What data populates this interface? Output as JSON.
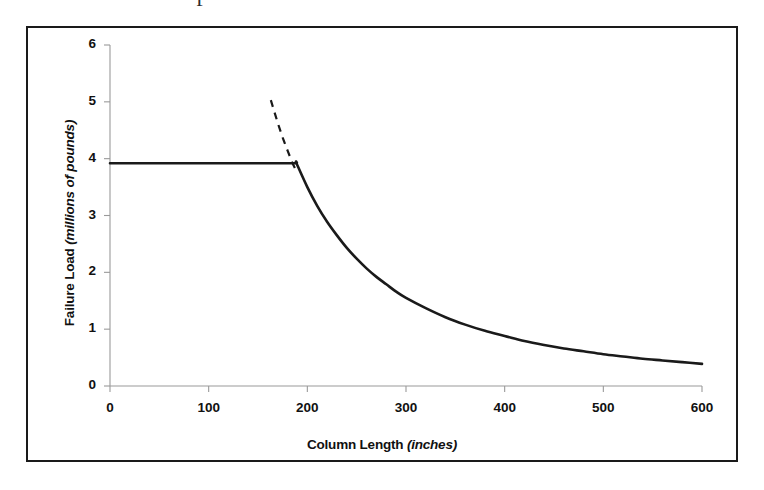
{
  "figure": {
    "stray_text_fragment": "f",
    "frame": {
      "border_color": "#1a1a1a"
    }
  },
  "chart_data": {
    "type": "line",
    "title": "",
    "subtitle": "",
    "xlabel_main": "Column Length ",
    "xlabel_units": "(inches)",
    "ylabel_main": "Failure Load ",
    "ylabel_units": "(millions of pounds)",
    "xlabel": "Column Length (inches)",
    "ylabel": "Failure Load (millions of pounds)",
    "xlim": [
      0,
      600
    ],
    "ylim": [
      0,
      6
    ],
    "xticks": [
      0,
      100,
      200,
      300,
      400,
      500,
      600
    ],
    "yticks": [
      0,
      1,
      2,
      3,
      4,
      5,
      6
    ],
    "xtick_labels": [
      "0",
      "100",
      "200",
      "300",
      "400",
      "500",
      "600"
    ],
    "ytick_labels": [
      "0",
      "1",
      "2",
      "3",
      "4",
      "5",
      "6"
    ],
    "grid": false,
    "legend": "none",
    "line_color": "#1a1a1a",
    "series": [
      {
        "name": "solid-failure-load-curve",
        "style": "solid",
        "x": [
          0,
          20,
          40,
          60,
          80,
          100,
          120,
          140,
          160,
          180,
          189,
          189,
          200,
          210,
          220,
          230,
          240,
          250,
          260,
          270,
          280,
          290,
          300,
          320,
          340,
          360,
          380,
          400,
          420,
          440,
          460,
          480,
          500,
          520,
          540,
          560,
          580,
          600
        ],
        "values": [
          3.92,
          3.92,
          3.92,
          3.92,
          3.92,
          3.92,
          3.92,
          3.92,
          3.92,
          3.92,
          3.92,
          3.92,
          3.5,
          3.17,
          2.89,
          2.65,
          2.43,
          2.24,
          2.07,
          1.92,
          1.79,
          1.66,
          1.55,
          1.37,
          1.21,
          1.08,
          0.97,
          0.88,
          0.79,
          0.72,
          0.66,
          0.61,
          0.56,
          0.52,
          0.48,
          0.45,
          0.42,
          0.39
        ]
      },
      {
        "name": "dashed-euler-extension",
        "style": "dashed",
        "x": [
          163,
          170,
          175,
          180,
          185,
          189
        ],
        "values": [
          5.03,
          4.63,
          4.37,
          4.14,
          3.92,
          3.78
        ]
      }
    ],
    "annotations": [
      {
        "label": "plateau-squash-load",
        "value": 3.92
      },
      {
        "label": "transition-length-inches",
        "value": 189
      }
    ]
  }
}
